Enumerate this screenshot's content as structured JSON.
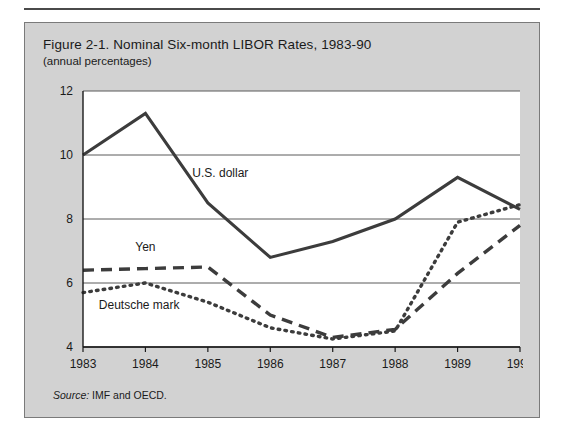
{
  "figure": {
    "title": "Figure 2-1.  Nominal Six-month LIBOR Rates, 1983-90",
    "subtitle": "(annual percentages)",
    "source_label": "Source:",
    "source_text": " IMF and OECD."
  },
  "colors": {
    "panel_background": "#d2d2d2",
    "plot_background": "#ffffff",
    "line": "#3c3c3c",
    "gridline": "#5a5a5a",
    "axis": "#1a1a1a",
    "text": "#1a1a1a"
  },
  "chart_data": {
    "type": "line",
    "title": "Figure 2-1.  Nominal Six-month LIBOR Rates, 1983-90",
    "subtitle": "(annual percentages)",
    "xlabel": "",
    "ylabel": "",
    "categories": [
      "1983",
      "1984",
      "1985",
      "1986",
      "1987",
      "1988",
      "1989",
      "1990"
    ],
    "x": [
      1983,
      1984,
      1985,
      1986,
      1987,
      1988,
      1989,
      1990
    ],
    "xlim": [
      1983,
      1990
    ],
    "ylim": [
      4,
      12
    ],
    "yticks": [
      4,
      6,
      8,
      10,
      12
    ],
    "ytick_labels": [
      "4",
      "6",
      "8",
      "10",
      "12"
    ],
    "grid": "horizontal",
    "legend": "inline-annotations",
    "series": [
      {
        "name": "U.S. dollar",
        "style": "solid",
        "label_x": 1985.2,
        "label_y": 9.3,
        "values": [
          10.0,
          11.3,
          8.5,
          6.8,
          7.3,
          8.0,
          9.3,
          8.3
        ]
      },
      {
        "name": "Yen",
        "style": "dashed",
        "label_x": 1984.0,
        "label_y": 7.0,
        "values": [
          6.4,
          6.45,
          6.5,
          5.0,
          4.3,
          4.55,
          6.3,
          7.8
        ]
      },
      {
        "name": "Deutsche mark",
        "style": "dotted",
        "label_x": 1983.9,
        "label_y": 5.2,
        "values": [
          5.7,
          6.0,
          5.4,
          4.6,
          4.25,
          4.5,
          7.9,
          8.45
        ]
      }
    ]
  }
}
